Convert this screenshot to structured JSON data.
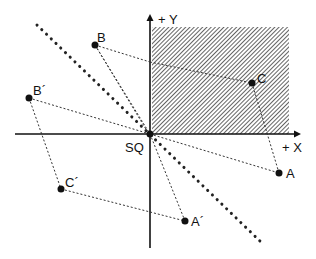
{
  "diagram": {
    "axes": {
      "x_label": "+ X",
      "y_label": "+ Y",
      "origin_label": "SQ"
    },
    "points": {
      "A": {
        "label": "A",
        "x": 279,
        "y": 173
      },
      "A_prime": {
        "label": "A´",
        "x": 185,
        "y": 221
      },
      "B": {
        "label": "B",
        "x": 95,
        "y": 45
      },
      "B_prime": {
        "label": "B´",
        "x": 29,
        "y": 98
      },
      "C": {
        "label": "C",
        "x": 252,
        "y": 83
      },
      "C_prime": {
        "label": "C´",
        "x": 61,
        "y": 189
      }
    },
    "shaded_region": "first quadrant (hatched)",
    "colors": {
      "ink": "#111111",
      "background": "#ffffff"
    }
  }
}
